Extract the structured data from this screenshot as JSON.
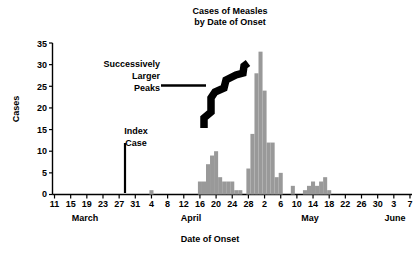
{
  "chart_data": {
    "type": "bar",
    "title": "Cases of Measles by Date of Onset",
    "title_line1": "Cases of Measles",
    "title_line2": "by Date of Onset",
    "xlabel": "Date of Onset",
    "ylabel": "Cases",
    "ylim": [
      0,
      35
    ],
    "y_ticks": [
      0,
      5,
      10,
      15,
      20,
      25,
      30,
      35
    ],
    "x_tick_labels": [
      "11",
      "15",
      "19",
      "23",
      "27",
      "31",
      "4",
      "8",
      "12",
      "16",
      "20",
      "24",
      "28",
      "2",
      "6",
      "10",
      "14",
      "18",
      "22",
      "26",
      "30",
      "3",
      "7"
    ],
    "x_month_labels": [
      "March",
      "April",
      "May",
      "June"
    ],
    "grid": false,
    "legend": false,
    "bar_color": "#999999",
    "axis_color": "#000000",
    "categories": [
      "Mar 11",
      "Mar 12",
      "Mar 13",
      "Mar 14",
      "Mar 15",
      "Mar 16",
      "Mar 17",
      "Mar 18",
      "Mar 19",
      "Mar 20",
      "Mar 21",
      "Mar 22",
      "Mar 23",
      "Mar 24",
      "Mar 25",
      "Mar 26",
      "Mar 27",
      "Mar 28",
      "Mar 29",
      "Mar 30",
      "Mar 31",
      "Apr 1",
      "Apr 2",
      "Apr 3",
      "Apr 4",
      "Apr 5",
      "Apr 6",
      "Apr 7",
      "Apr 8",
      "Apr 9",
      "Apr 10",
      "Apr 11",
      "Apr 12",
      "Apr 13",
      "Apr 14",
      "Apr 15",
      "Apr 16",
      "Apr 17",
      "Apr 18",
      "Apr 19",
      "Apr 20",
      "Apr 21",
      "Apr 22",
      "Apr 23",
      "Apr 24",
      "Apr 25",
      "Apr 26",
      "Apr 27",
      "Apr 28",
      "Apr 29",
      "Apr 30",
      "May 1",
      "May 2",
      "May 3",
      "May 4",
      "May 5",
      "May 6",
      "May 7",
      "May 8",
      "May 9",
      "May 10",
      "May 11",
      "May 12",
      "May 13",
      "May 14",
      "May 15",
      "May 16",
      "May 17",
      "May 18",
      "May 19",
      "May 20",
      "May 21",
      "May 22",
      "May 23",
      "May 24",
      "May 25",
      "May 26",
      "May 27",
      "May 28",
      "May 29",
      "May 30",
      "May 31",
      "Jun 1",
      "Jun 2",
      "Jun 3",
      "Jun 4",
      "Jun 5",
      "Jun 6",
      "Jun 7"
    ],
    "values": [
      0,
      0,
      0,
      0,
      0,
      0,
      0,
      0,
      0,
      0,
      0,
      0,
      0,
      0,
      0,
      0,
      0,
      0,
      0,
      0,
      0,
      0,
      0,
      0,
      1,
      0,
      0,
      0,
      0,
      0,
      0,
      0,
      0,
      0,
      0,
      0,
      3,
      3,
      7,
      9,
      10,
      4,
      3,
      3,
      3,
      1,
      1,
      0,
      6,
      14,
      28,
      33,
      24,
      12,
      12,
      4,
      5,
      0,
      0,
      2,
      0,
      0,
      1,
      2,
      3,
      2,
      3,
      4,
      1,
      0,
      0,
      0,
      0,
      0,
      0,
      0,
      0,
      0,
      0,
      0,
      0,
      0,
      0,
      0,
      0,
      0,
      0,
      0,
      0
    ],
    "annotations": [
      {
        "name": "successively-larger-peaks",
        "text_line1": "Successively",
        "text_line2": "Larger",
        "text_line3": "Peaks",
        "full_text": "Successively Larger Peaks"
      },
      {
        "name": "index-case",
        "text_line1": "Index",
        "text_line2": "Case",
        "full_text": "Index Case",
        "points_to": "Apr 4"
      }
    ]
  }
}
